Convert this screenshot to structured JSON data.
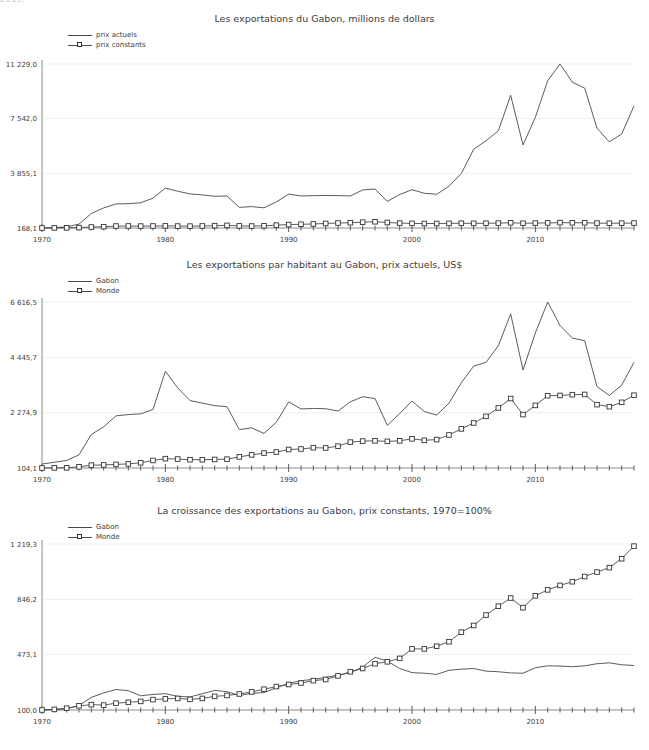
{
  "page": {
    "clipped_top_text": "2019.",
    "background": "#ffffff",
    "line_color": "#4a4a4a",
    "grid_color": "#f0f0f0",
    "axis_color": "#8a8a8a"
  },
  "charts": [
    {
      "id": "chart1",
      "title": "Les exportations du Gabon, millions de dollars",
      "legend": [
        {
          "label": "prix actuels",
          "marker": "none"
        },
        {
          "label": "prix constants",
          "marker": "square"
        }
      ],
      "chart_data": {
        "type": "line",
        "title": "Les exportations du Gabon, millions de dollars",
        "xlabel": "",
        "ylabel": "",
        "grid": true,
        "legend_position": "top-left",
        "ylim": [
          168.1,
          11229.0
        ],
        "yticks": [
          168.1,
          3855.1,
          7542.0,
          11229.0
        ],
        "ytick_labels": [
          "168,1",
          "3 855,1",
          "7 542,0",
          "11 229,0"
        ],
        "xlim": [
          1970,
          2018
        ],
        "xticks": [
          1970,
          1980,
          1990,
          2000,
          2010
        ],
        "xtick_labels": [
          "1970",
          "1980",
          "1990",
          "2000",
          "2010"
        ],
        "x": [
          1970,
          1971,
          1972,
          1973,
          1974,
          1975,
          1976,
          1977,
          1978,
          1979,
          1980,
          1981,
          1982,
          1983,
          1984,
          1985,
          1986,
          1987,
          1988,
          1989,
          1990,
          1991,
          1992,
          1993,
          1994,
          1995,
          1996,
          1997,
          1998,
          1999,
          2000,
          2001,
          2002,
          2003,
          2004,
          2005,
          2006,
          2007,
          2008,
          2009,
          2010,
          2011,
          2012,
          2013,
          2014,
          2015,
          2016,
          2017,
          2018
        ],
        "series": [
          {
            "name": "prix actuels",
            "marker": "none",
            "values": [
              168.1,
              200.0,
              240.0,
              430.0,
              1150.0,
              1520.0,
              1790.0,
              1810.0,
              1870.0,
              2180.0,
              2860.0,
              2650.0,
              2470.0,
              2400.0,
              2310.0,
              2330.0,
              1560.0,
              1610.0,
              1530.0,
              1930.0,
              2450.0,
              2330.0,
              2350.0,
              2360.0,
              2350.0,
              2330.0,
              2730.0,
              2800.0,
              1960.0,
              2430.0,
              2750.0,
              2510.0,
              2440.0,
              2990.0,
              3850.0,
              5480.0,
              6050.0,
              6720.0,
              9120.0,
              5770.0,
              7630.0,
              10100.0,
              11229.0,
              10000.0,
              9600.0,
              6900.0,
              5980.0,
              6500.0,
              8400.0
            ]
          },
          {
            "name": "prix constants",
            "marker": "square",
            "values": [
              168.1,
              176.0,
              180.0,
              196.0,
              235.0,
              255.0,
              300.0,
              305.0,
              298.0,
              303.0,
              310.0,
              300.0,
              295.0,
              305.0,
              325.0,
              345.0,
              310.0,
              300.0,
              315.0,
              360.0,
              400.0,
              420.0,
              440.0,
              475.0,
              505.0,
              525.0,
              560.0,
              590.0,
              540.0,
              500.0,
              480.0,
              470.0,
              470.0,
              480.0,
              490.0,
              480.0,
              490.0,
              500.0,
              520.0,
              490.0,
              500.0,
              510.0,
              530.0,
              520.0,
              520.0,
              500.0,
              490.0,
              495.0,
              500.0
            ]
          }
        ]
      }
    },
    {
      "id": "chart2",
      "title": "Les exportations par habitant au Gabon, prix actuels, US$",
      "legend": [
        {
          "label": "Gabon",
          "marker": "none"
        },
        {
          "label": "Monde",
          "marker": "square"
        }
      ],
      "chart_data": {
        "type": "line",
        "title": "Les exportations par habitant au Gabon, prix actuels, US$",
        "xlabel": "",
        "ylabel": "",
        "grid": true,
        "legend_position": "top-left",
        "ylim": [
          104.1,
          6616.5
        ],
        "yticks": [
          104.1,
          2274.9,
          4445.7,
          6616.5
        ],
        "ytick_labels": [
          "104,1",
          "2 274,9",
          "4 445,7",
          "6 616,5"
        ],
        "xlim": [
          1970,
          2018
        ],
        "xticks": [
          1970,
          1980,
          1990,
          2000,
          2010
        ],
        "xtick_labels": [
          "1970",
          "1980",
          "1990",
          "2000",
          "2010"
        ],
        "x": [
          1970,
          1971,
          1972,
          1973,
          1974,
          1975,
          1976,
          1977,
          1978,
          1979,
          1980,
          1981,
          1982,
          1983,
          1984,
          1985,
          1986,
          1987,
          1988,
          1989,
          1990,
          1991,
          1992,
          1993,
          1994,
          1995,
          1996,
          1997,
          1998,
          1999,
          2000,
          2001,
          2002,
          2003,
          2004,
          2005,
          2006,
          2007,
          2008,
          2009,
          2010,
          2011,
          2012,
          2013,
          2014,
          2015,
          2016,
          2017,
          2018
        ],
        "series": [
          {
            "name": "Gabon",
            "marker": "none",
            "values": [
              260.0,
              330.0,
              400.0,
              620.0,
              1420.0,
              1720.0,
              2150.0,
              2200.0,
              2230.0,
              2400.0,
              3900.0,
              3250.0,
              2750.0,
              2650.0,
              2550.0,
              2510.0,
              1610.0,
              1680.0,
              1460.0,
              1900.0,
              2700.0,
              2420.0,
              2440.0,
              2430.0,
              2340.0,
              2700.0,
              2900.0,
              2830.0,
              1780.0,
              2240.0,
              2730.0,
              2320.0,
              2180.0,
              2650.0,
              3450.0,
              4100.0,
              4250.0,
              4900.0,
              6150.0,
              3950.0,
              5400.0,
              6616.5,
              5700.0,
              5200.0,
              5100.0,
              3300.0,
              2950.0,
              3350.0,
              4250.0
            ]
          },
          {
            "name": "Monde",
            "marker": "square",
            "values": [
              104.1,
              110.0,
              112.0,
              150.0,
              215.0,
              225.0,
              245.0,
              265.0,
              310.0,
              400.0,
              470.0,
              455.0,
              430.0,
              430.0,
              440.0,
              450.0,
              540.0,
              620.0,
              690.0,
              730.0,
              830.0,
              850.0,
              900.0,
              890.0,
              960.0,
              1120.0,
              1160.0,
              1170.0,
              1150.0,
              1170.0,
              1250.0,
              1190.0,
              1220.0,
              1400.0,
              1640.0,
              1870.0,
              2130.0,
              2460.0,
              2830.0,
              2200.0,
              2560.0,
              2940.0,
              2950.0,
              2980.0,
              2990.0,
              2590.0,
              2510.0,
              2680.0,
              2960.0
            ]
          }
        ]
      }
    },
    {
      "id": "chart3",
      "title": "La croissance des exportations au Gabon, prix constants, 1970=100%",
      "legend": [
        {
          "label": "Gabon",
          "marker": "none"
        },
        {
          "label": "Monde",
          "marker": "square"
        }
      ],
      "chart_data": {
        "type": "line",
        "title": "La croissance des exportations au Gabon, prix constants, 1970=100%",
        "xlabel": "",
        "ylabel": "",
        "grid": true,
        "legend_position": "top-left",
        "ylim": [
          100.0,
          1219.3
        ],
        "yticks": [
          100.0,
          473.1,
          846.2,
          1219.3
        ],
        "ytick_labels": [
          "100,0",
          "473,1",
          "846,2",
          "1 219,3"
        ],
        "xlim": [
          1970,
          2018
        ],
        "xticks": [
          1970,
          1980,
          1990,
          2000,
          2010
        ],
        "xtick_labels": [
          "1970",
          "1980",
          "1990",
          "2000",
          "2010"
        ],
        "x": [
          1970,
          1971,
          1972,
          1973,
          1974,
          1975,
          1976,
          1977,
          1978,
          1979,
          1980,
          1981,
          1982,
          1983,
          1984,
          1985,
          1986,
          1987,
          1988,
          1989,
          1990,
          1991,
          1992,
          1993,
          1994,
          1995,
          1996,
          1997,
          1998,
          1999,
          2000,
          2001,
          2002,
          2003,
          2004,
          2005,
          2006,
          2007,
          2008,
          2009,
          2010,
          2011,
          2012,
          2013,
          2014,
          2015,
          2016,
          2017,
          2018
        ],
        "series": [
          {
            "name": "Gabon",
            "marker": "none",
            "values": [
              100.0,
              103.0,
              108.0,
              130.0,
              185.0,
              215.0,
              238.0,
              230.0,
              196.0,
              205.0,
              210.0,
              192.0,
              188.0,
              210.0,
              232.0,
              224.0,
              198.0,
              212.0,
              218.0,
              250.0,
              280.0,
              298.0,
              306.0,
              320.0,
              335.0,
              352.0,
              390.0,
              455.0,
              430.0,
              380.0,
              352.0,
              348.0,
              340.0,
              368.0,
              375.0,
              380.0,
              362.0,
              358.0,
              350.0,
              348.0,
              385.0,
              398.0,
              396.0,
              392.0,
              398.0,
              412.0,
              418.0,
              405.0,
              400.0
            ]
          },
          {
            "name": "Monde",
            "marker": "square",
            "values": [
              100.0,
              104.0,
              112.0,
              128.0,
              136.0,
              133.0,
              146.0,
              152.0,
              158.0,
              170.0,
              175.0,
              178.0,
              172.0,
              178.0,
              192.0,
              198.0,
              208.0,
              222.0,
              240.0,
              258.0,
              272.0,
              282.0,
              298.0,
              306.0,
              330.0,
              358.0,
              380.0,
              412.0,
              425.0,
              448.0,
              512.0,
              512.0,
              530.0,
              560.0,
              625.0,
              670.0,
              740.0,
              800.0,
              855.0,
              790.0,
              870.0,
              910.0,
              940.0,
              965.0,
              1000.0,
              1030.0,
              1060.0,
              1120.0,
              1205.0
            ]
          }
        ]
      }
    }
  ]
}
